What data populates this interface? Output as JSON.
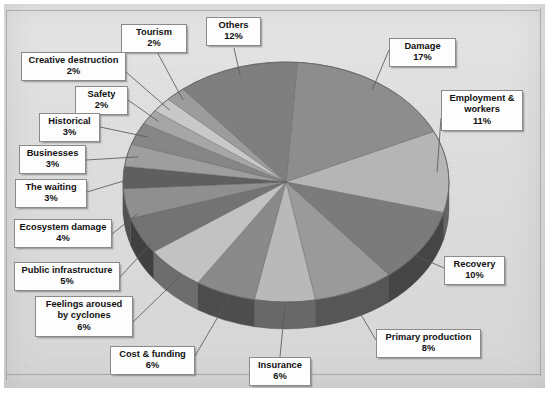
{
  "chart_data": {
    "type": "pie",
    "title": "",
    "subtitle": "",
    "xlabel": "",
    "ylabel": "",
    "legend_position": "callout-labels",
    "grid": false,
    "unit": "%",
    "style": "3d-pie-grayscale",
    "categories": [
      "Damage",
      "Employment & workers",
      "Recovery",
      "Primary production",
      "Insurance",
      "Cost & funding",
      "Feelings aroused by cyclones",
      "Public infrastructure",
      "Ecosystem damage",
      "The waiting",
      "Businesses",
      "Historical",
      "Safety",
      "Creative destruction",
      "Tourism",
      "Others"
    ],
    "values": [
      17,
      11,
      10,
      8,
      6,
      6,
      6,
      5,
      4,
      3,
      3,
      3,
      2,
      2,
      2,
      12
    ],
    "slices": [
      {
        "label": "Damage",
        "value": 17,
        "pct_text": "17%",
        "color": "#8d8d8d"
      },
      {
        "label": "Employment & workers",
        "value": 11,
        "pct_text": "11%",
        "color": "#b5b5b5"
      },
      {
        "label": "Recovery",
        "value": 10,
        "pct_text": "10%",
        "color": "#7b7b7b"
      },
      {
        "label": "Primary production",
        "value": 8,
        "pct_text": "8%",
        "color": "#9a9a9a"
      },
      {
        "label": "Insurance",
        "value": 6,
        "pct_text": "6%",
        "color": "#b9b9b9"
      },
      {
        "label": "Cost & funding",
        "value": 6,
        "pct_text": "6%",
        "color": "#8a8a8a"
      },
      {
        "label": "Feelings aroused by cyclones",
        "value": 6,
        "pct_text": "6%",
        "color": "#c2c2c2"
      },
      {
        "label": "Public infrastructure",
        "value": 5,
        "pct_text": "5%",
        "color": "#737373"
      },
      {
        "label": "Ecosystem damage",
        "value": 4,
        "pct_text": "4%",
        "color": "#8f8f8f"
      },
      {
        "label": "The waiting",
        "value": 3,
        "pct_text": "3%",
        "color": "#5f5f5f"
      },
      {
        "label": "Businesses",
        "value": 3,
        "pct_text": "3%",
        "color": "#9e9e9e"
      },
      {
        "label": "Historical",
        "value": 3,
        "pct_text": "3%",
        "color": "#868686"
      },
      {
        "label": "Safety",
        "value": 2,
        "pct_text": "2%",
        "color": "#a6a6a6"
      },
      {
        "label": "Creative destruction",
        "value": 2,
        "pct_text": "2%",
        "color": "#c8c8c8"
      },
      {
        "label": "Tourism",
        "value": 2,
        "pct_text": "2%",
        "color": "#9c9c9c"
      },
      {
        "label": "Others",
        "value": 12,
        "pct_text": "12%",
        "color": "#7f7f7f"
      }
    ]
  },
  "labels": {
    "tourism": {
      "name": "Tourism",
      "pct": "2%"
    },
    "creative_destruction": {
      "name": "Creative destruction",
      "pct": "2%"
    },
    "safety": {
      "name": "Safety",
      "pct": "2%"
    },
    "historical": {
      "name": "Historical",
      "pct": "3%"
    },
    "businesses": {
      "name": "Businesses",
      "pct": "3%"
    },
    "the_waiting": {
      "name": "The  waiting",
      "pct": "3%"
    },
    "ecosystem_damage": {
      "name": "Ecosystem damage",
      "pct": "4%"
    },
    "public_infrastructure": {
      "name": "Public infrastructure",
      "pct": "5%"
    },
    "feelings": {
      "name": "Feelings aroused by cyclones",
      "pct": "6%"
    },
    "cost_funding": {
      "name": "Cost &  funding",
      "pct": "6%"
    },
    "insurance": {
      "name": "Insurance",
      "pct": "6%"
    },
    "primary_production": {
      "name": "Primary production",
      "pct": "8%"
    },
    "recovery": {
      "name": "Recovery",
      "pct": "10%"
    },
    "employment": {
      "name": "Employment &  workers",
      "pct": "11%"
    },
    "damage": {
      "name": "Damage",
      "pct": "17%"
    },
    "others": {
      "name": "Others",
      "pct": "12%"
    }
  },
  "colors": {
    "page_background": "#e3e3e3",
    "label_background": "#fdfdfd",
    "label_border": "#8a8a8a",
    "label_text": "#111111",
    "leader_line": "#5a5a5a",
    "pie_edge": "#6a6a6a"
  }
}
